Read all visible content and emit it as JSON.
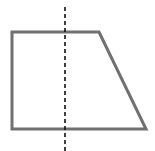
{
  "diagram": {
    "type": "geometry",
    "shape": {
      "name": "trapezoid",
      "points": [
        [
          12,
          32
        ],
        [
          99,
          32
        ],
        [
          146,
          129
        ],
        [
          12,
          129
        ]
      ],
      "stroke": "#707070",
      "stroke_width": 3,
      "fill": "none"
    },
    "line": {
      "name": "dashed-vertical-line",
      "x": 65,
      "y1": 7,
      "y2": 151,
      "stroke": "#111111",
      "stroke_width": 1.6,
      "dash": "4,3"
    }
  }
}
